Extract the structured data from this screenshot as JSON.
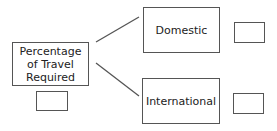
{
  "diagram": {
    "root": {
      "label_lines": [
        "Percentage",
        "of Travel",
        "Required"
      ]
    },
    "branches": [
      {
        "label": "Domestic"
      },
      {
        "label": "International"
      }
    ],
    "line_color": "#555555"
  }
}
